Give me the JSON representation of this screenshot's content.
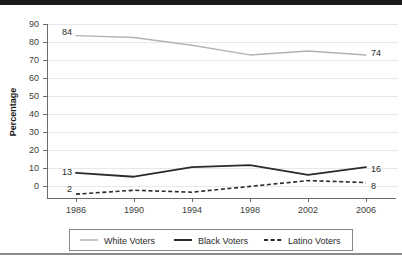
{
  "chart_data": {
    "type": "line",
    "title": "",
    "xlabel": "",
    "ylabel": "Percentage",
    "categories": [
      "1986",
      "1990",
      "1994",
      "1998",
      "2002",
      "2006"
    ],
    "x": [
      1986,
      1990,
      1994,
      1998,
      2002,
      2006
    ],
    "ylim": [
      0,
      90
    ],
    "ytick_step": 10,
    "yticks": [
      "0",
      "10",
      "20",
      "30",
      "40",
      "50",
      "60",
      "70",
      "80",
      "90"
    ],
    "grid": true,
    "legend_position": "bottom",
    "series": [
      {
        "name": "White Voters",
        "values": [
          84,
          83,
          79,
          74,
          76,
          74
        ],
        "style": "solid",
        "color": "#b3b3b3",
        "width": 1.4
      },
      {
        "name": "Black Voters",
        "values": [
          13,
          11,
          16,
          17,
          12,
          16
        ],
        "style": "solid",
        "color": "#2b2b2b",
        "width": 1.8
      },
      {
        "name": "Latino Voters",
        "values": [
          2,
          4,
          3,
          6,
          9,
          8
        ],
        "style": "dashed",
        "color": "#2b2b2b",
        "width": 1.6
      }
    ],
    "annotations": [
      {
        "text": "84",
        "series": "White Voters",
        "category": "1986",
        "value": 84,
        "placement": "left"
      },
      {
        "text": "74",
        "series": "White Voters",
        "category": "2006",
        "value": 74,
        "placement": "right"
      },
      {
        "text": "13",
        "series": "Black Voters",
        "category": "1986",
        "value": 13,
        "placement": "left"
      },
      {
        "text": "16",
        "series": "Black Voters",
        "category": "2006",
        "value": 16,
        "placement": "right"
      },
      {
        "text": "2",
        "series": "Latino Voters",
        "category": "1986",
        "value": 2,
        "placement": "left"
      },
      {
        "text": "8",
        "series": "Latino Voters",
        "category": "2006",
        "value": 8,
        "placement": "right"
      }
    ]
  },
  "legend": {
    "entries": [
      {
        "label": "White Voters"
      },
      {
        "label": "Black Voters"
      },
      {
        "label": "Latino Voters"
      }
    ]
  },
  "colors": {
    "white_voters": "#b3b3b3",
    "black_voters": "#2b2b2b",
    "latino_voters": "#2b2b2b",
    "grid": "#e8e8e8",
    "axis": "#6b6b6b",
    "rule_top": "#1a1a1a",
    "rule_bottom": "#8a8a8a",
    "background": "#ffffff"
  }
}
